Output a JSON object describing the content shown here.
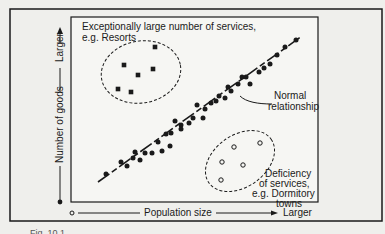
{
  "figure": {
    "title_top_left": "Exceptionally large number of services,",
    "title_top_left_line2": "e.g. Resorts",
    "normal_label_line1": "Normal",
    "normal_label_line2": "relationship",
    "deficiency_line1": "Deficiency",
    "deficiency_line2": "of services,",
    "deficiency_line3": "e.g. Dormitory",
    "deficiency_line4": "towns",
    "x_axis": {
      "origin_symbol": "o",
      "label": "Population size",
      "end_label": "Larger"
    },
    "y_axis": {
      "label": "Number of goods",
      "end_label": "Larger"
    },
    "caption": "Fig. 10.1"
  },
  "chart_data": {
    "type": "scatter",
    "title": "",
    "xlabel": "Population size",
    "ylabel": "Number of goods",
    "series": [
      {
        "name": "Normal relationship",
        "marker": "filled-circle",
        "points": [
          [
            106,
            174
          ],
          [
            121,
            162
          ],
          [
            127,
            166
          ],
          [
            133,
            158
          ],
          [
            135,
            152
          ],
          [
            140,
            160
          ],
          [
            145,
            153
          ],
          [
            152,
            153
          ],
          [
            158,
            142
          ],
          [
            162,
            151
          ],
          [
            166,
            134
          ],
          [
            170,
            146
          ],
          [
            171,
            133
          ],
          [
            175,
            121
          ],
          [
            181,
            129
          ],
          [
            181,
            125
          ],
          [
            189,
            123
          ],
          [
            193,
            118
          ],
          [
            197,
            105
          ],
          [
            203,
            118
          ],
          [
            205,
            109
          ],
          [
            211,
            103
          ],
          [
            216,
            101
          ],
          [
            219,
            96
          ],
          [
            225,
            98
          ],
          [
            228,
            87
          ],
          [
            231,
            91
          ],
          [
            238,
            84
          ],
          [
            242,
            77
          ],
          [
            246,
            77
          ],
          [
            250,
            84
          ],
          [
            259,
            72
          ],
          [
            264,
            68
          ],
          [
            270,
            64
          ],
          [
            277,
            55
          ],
          [
            285,
            47
          ],
          [
            296,
            40
          ]
        ]
      },
      {
        "name": "Exceptionally large number of services (Resorts)",
        "marker": "filled-square",
        "points": [
          [
            118,
            89
          ],
          [
            124,
            65
          ],
          [
            131,
            92
          ],
          [
            138,
            75
          ],
          [
            153,
            69
          ],
          [
            155,
            47
          ]
        ]
      },
      {
        "name": "Deficiency of services (Dormitory towns)",
        "marker": "open-circle",
        "points": [
          [
            221,
            180
          ],
          [
            222,
            162
          ],
          [
            234,
            147
          ],
          [
            243,
            165
          ],
          [
            260,
            143
          ]
        ]
      }
    ],
    "trend_line": {
      "from": [
        98,
        182
      ],
      "to": [
        302,
        36
      ],
      "style": "dashed-solid"
    },
    "annotations": [
      "Exceptionally large number of services, e.g. Resorts",
      "Normal relationship",
      "Deficiency of services, e.g. Dormitory towns"
    ]
  }
}
